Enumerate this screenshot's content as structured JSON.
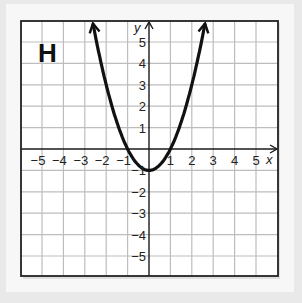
{
  "panel_label": "H",
  "chart_data": {
    "type": "line",
    "title": "H",
    "function": "y = x^2 - 1",
    "xlabel": "x",
    "ylabel": "y",
    "xlim": [
      -6,
      6
    ],
    "ylim": [
      -6,
      6
    ],
    "x_ticks": [
      -5,
      -4,
      -3,
      -2,
      -1,
      1,
      2,
      3,
      4,
      5
    ],
    "y_ticks": [
      5,
      4,
      3,
      2,
      1,
      -1,
      -2,
      -3,
      -4,
      -5
    ],
    "grid": true,
    "series": [
      {
        "name": "parabola",
        "vertex": [
          0,
          -1
        ],
        "x_intercepts": [
          -1,
          1
        ],
        "points": [
          [
            -2.6,
            5.76
          ],
          [
            -2,
            3
          ],
          [
            -1,
            0
          ],
          [
            0,
            -1
          ],
          [
            1,
            0
          ],
          [
            2,
            3
          ],
          [
            2.6,
            5.76
          ]
        ],
        "end_arrows": true
      }
    ]
  },
  "labels": {
    "x_axis": "x",
    "y_axis": "y",
    "x_ticks": [
      "−5",
      "−4",
      "−3",
      "−2",
      "−1",
      "1",
      "2",
      "3",
      "4",
      "5"
    ],
    "y_ticks": [
      "5",
      "4",
      "3",
      "2",
      "1",
      "−1",
      "−2",
      "−3",
      "−4",
      "−5"
    ]
  },
  "colors": {
    "grid": "#bdbdbd",
    "axis": "#1a1a1a",
    "curve": "#111111",
    "frame": "#222222"
  }
}
